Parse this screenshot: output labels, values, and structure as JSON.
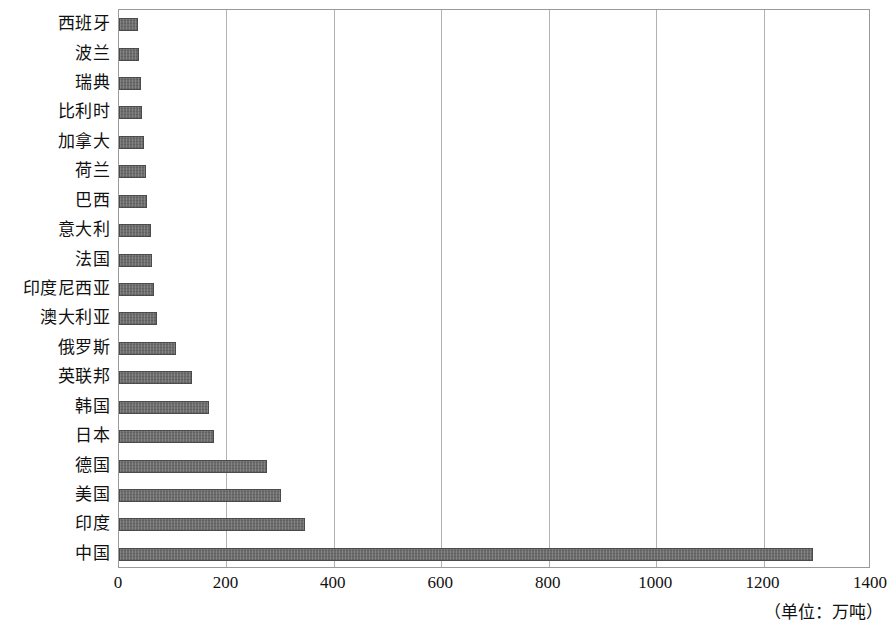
{
  "chart_data": {
    "type": "bar",
    "orientation": "horizontal",
    "title": "",
    "xlabel": "",
    "ylabel": "",
    "unit_note": "（单位：万吨）",
    "xlim": [
      0,
      1400
    ],
    "xticks": [
      0,
      200,
      400,
      600,
      800,
      1000,
      1200,
      1400
    ],
    "xtick_labels": [
      "0",
      "200",
      "400",
      "600",
      "800",
      "1000",
      "1200",
      "1400"
    ],
    "grid": "vertical",
    "legend": "none",
    "bar_color": "#6d6d6d",
    "bar_edge_color": "#4b4b4b",
    "gridline_color": "#b2b2b2",
    "axis_color": "#9a9a9a",
    "categories": [
      "西班牙",
      "波兰",
      "瑞典",
      "比利时",
      "加拿大",
      "荷兰",
      "巴西",
      "意大利",
      "法国",
      "印度尼西亚",
      "澳大利亚",
      "俄罗斯",
      "英联邦",
      "韩国",
      "日本",
      "德国",
      "美国",
      "印度",
      "中国"
    ],
    "values": [
      35,
      37,
      41,
      43,
      46,
      50,
      52,
      60,
      62,
      65,
      70,
      107,
      135,
      168,
      177,
      275,
      301,
      346,
      1292
    ]
  }
}
